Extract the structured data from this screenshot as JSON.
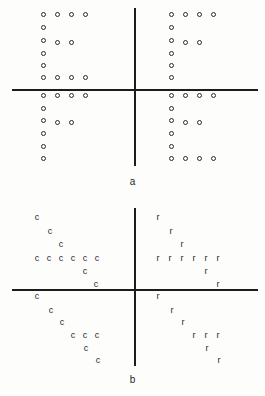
{
  "figure": {
    "title": "",
    "panels": [
      {
        "id": "a",
        "label": "a",
        "marker_type": "circle",
        "axis": {
          "h_y": 89,
          "h_x1": 12,
          "h_x2": 258,
          "v_x": 134,
          "v_y1": 8,
          "v_y2": 166
        },
        "quadrants": [
          {
            "name": "upper-left",
            "pattern": "E",
            "symbol": "o"
          },
          {
            "name": "upper-right",
            "pattern": "F",
            "symbol": "o"
          },
          {
            "name": "lower-left",
            "pattern": "F",
            "symbol": "o"
          },
          {
            "name": "lower-right",
            "pattern": "E",
            "symbol": "o"
          }
        ],
        "points": [
          [
            43,
            14
          ],
          [
            57,
            14
          ],
          [
            71,
            14
          ],
          [
            85,
            14
          ],
          [
            43,
            27
          ],
          [
            43,
            40
          ],
          [
            57,
            42
          ],
          [
            71,
            42
          ],
          [
            43,
            53
          ],
          [
            43,
            65
          ],
          [
            43,
            77
          ],
          [
            57,
            77
          ],
          [
            71,
            77
          ],
          [
            85,
            77
          ],
          [
            43,
            95
          ],
          [
            57,
            95
          ],
          [
            71,
            95
          ],
          [
            85,
            95
          ],
          [
            43,
            108
          ],
          [
            43,
            120
          ],
          [
            57,
            122
          ],
          [
            71,
            122
          ],
          [
            43,
            133
          ],
          [
            43,
            146
          ],
          [
            43,
            158
          ],
          [
            171,
            14
          ],
          [
            185,
            14
          ],
          [
            199,
            14
          ],
          [
            213,
            14
          ],
          [
            171,
            27
          ],
          [
            171,
            40
          ],
          [
            185,
            42
          ],
          [
            199,
            42
          ],
          [
            171,
            53
          ],
          [
            171,
            65
          ],
          [
            171,
            77
          ],
          [
            171,
            95
          ],
          [
            185,
            95
          ],
          [
            199,
            95
          ],
          [
            213,
            95
          ],
          [
            171,
            108
          ],
          [
            171,
            120
          ],
          [
            185,
            122
          ],
          [
            199,
            122
          ],
          [
            171,
            133
          ],
          [
            171,
            146
          ],
          [
            171,
            158
          ],
          [
            185,
            158
          ],
          [
            199,
            158
          ],
          [
            213,
            158
          ]
        ]
      },
      {
        "id": "b",
        "label": "b",
        "marker_type": "glyph",
        "axis": {
          "h_y": 91,
          "h_x1": 12,
          "h_x2": 258,
          "v_x": 134,
          "v_y1": 10,
          "v_y2": 168
        },
        "quadrants": [
          {
            "name": "upper-left",
            "pattern": "chevron-right",
            "symbol": "c"
          },
          {
            "name": "upper-right",
            "pattern": "chevron-left",
            "symbol": "r"
          },
          {
            "name": "lower-left",
            "pattern": "chevron-right",
            "symbol": "c"
          },
          {
            "name": "lower-right",
            "pattern": "chevron-left",
            "symbol": "r"
          }
        ],
        "points": [
          [
            "c",
            37,
            19
          ],
          [
            "c",
            50,
            33
          ],
          [
            "c",
            61,
            46
          ],
          [
            "c",
            37,
            60
          ],
          [
            "c",
            49,
            60
          ],
          [
            "c",
            61,
            60
          ],
          [
            "c",
            73,
            60
          ],
          [
            "c",
            85,
            60
          ],
          [
            "c",
            97,
            60
          ],
          [
            "c",
            85,
            73
          ],
          [
            "c",
            96,
            86
          ],
          [
            "c",
            37,
            98
          ],
          [
            "c",
            51,
            112
          ],
          [
            "c",
            62,
            124
          ],
          [
            "c",
            73,
            137
          ],
          [
            "c",
            85,
            137
          ],
          [
            "c",
            97,
            137
          ],
          [
            "c",
            86,
            150
          ],
          [
            "c",
            98,
            162
          ],
          [
            "r",
            158,
            19
          ],
          [
            "r",
            171,
            33
          ],
          [
            "r",
            182,
            46
          ],
          [
            "r",
            158,
            60
          ],
          [
            "r",
            170,
            60
          ],
          [
            "r",
            182,
            60
          ],
          [
            "r",
            194,
            60
          ],
          [
            "r",
            206,
            60
          ],
          [
            "r",
            218,
            60
          ],
          [
            "r",
            206,
            73
          ],
          [
            "r",
            218,
            86
          ],
          [
            "r",
            158,
            98
          ],
          [
            "r",
            172,
            112
          ],
          [
            "r",
            183,
            124
          ],
          [
            "r",
            194,
            137
          ],
          [
            "r",
            206,
            137
          ],
          [
            "r",
            218,
            137
          ],
          [
            "r",
            207,
            150
          ],
          [
            "r",
            219,
            162
          ]
        ]
      }
    ]
  },
  "colors": {
    "background": "#fdfdfc",
    "axis": "#1c1c1c",
    "marker_stroke": "#2a2a2a",
    "glyph": "#2b2b2b",
    "label": "#1f1f1f"
  }
}
